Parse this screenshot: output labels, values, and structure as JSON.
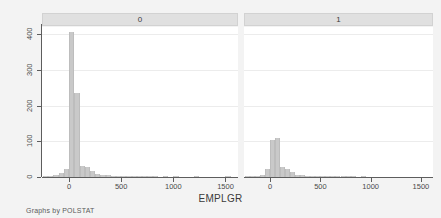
{
  "figure": {
    "note": "Graphs by POLSTAT",
    "xlabel": "EMPLGR",
    "ylabel": "",
    "background_color": "#f3f3f3",
    "panel_color": "#ffffff",
    "bar_color": "#c9c9c9",
    "axis_color": "#5d5d5d",
    "strip_color": "#e0e0e0"
  },
  "panels": [
    {
      "label": "0"
    },
    {
      "label": "1"
    }
  ],
  "axes": {
    "y": {
      "ticks": [
        0,
        100,
        200,
        300,
        400
      ],
      "tick_labels": [
        "0",
        "100",
        "200",
        "300",
        "400"
      ],
      "min": 0,
      "max": 420
    },
    "x": {
      "ticks": [
        0,
        500,
        1000,
        1500
      ],
      "tick_labels": [
        "0",
        "500",
        "1000",
        "1500"
      ],
      "min": -260,
      "max": 1620
    }
  },
  "chart_data": {
    "type": "bar",
    "title": "",
    "subtitle": "",
    "xlabel": "EMPLGR",
    "ylabel": "Frequency",
    "xlim": [
      -260,
      1620
    ],
    "ylim": [
      0,
      420
    ],
    "grid": true,
    "legend": "none",
    "facet_by": "POLSTAT",
    "note": "Graphs by POLSTAT",
    "panels": [
      {
        "name": "0",
        "bin_width": 50,
        "bin_starts": [
          -250,
          -200,
          -150,
          -100,
          -50,
          0,
          50,
          100,
          150,
          200,
          250,
          300,
          350,
          400,
          450,
          500,
          550,
          600,
          650,
          700,
          750,
          800,
          850,
          900,
          950,
          1000,
          1050,
          1100,
          1150,
          1200,
          1250,
          1300,
          1350,
          1400,
          1450,
          1500,
          1550
        ],
        "values": [
          2,
          3,
          6,
          10,
          22,
          405,
          235,
          32,
          27,
          18,
          9,
          6,
          5,
          3,
          3,
          2,
          2,
          1,
          1,
          1,
          1,
          1,
          0,
          1,
          0,
          1,
          0,
          0,
          0,
          1,
          0,
          0,
          0,
          0,
          0,
          1,
          0
        ]
      },
      {
        "name": "1",
        "bin_width": 50,
        "bin_starts": [
          -250,
          -200,
          -150,
          -100,
          -50,
          0,
          50,
          100,
          150,
          200,
          250,
          300,
          350,
          400,
          450,
          500,
          550,
          600,
          650,
          700,
          750,
          800,
          850,
          900,
          950,
          1000,
          1050,
          1100,
          1150,
          1200,
          1250,
          1300,
          1350,
          1400,
          1450,
          1500,
          1550
        ],
        "values": [
          1,
          2,
          3,
          6,
          22,
          103,
          110,
          28,
          22,
          14,
          7,
          5,
          4,
          3,
          2,
          2,
          1,
          1,
          1,
          3,
          1,
          1,
          0,
          1,
          0,
          0,
          0,
          0,
          0,
          0,
          0,
          0,
          0,
          0,
          0,
          0,
          0
        ]
      }
    ]
  }
}
